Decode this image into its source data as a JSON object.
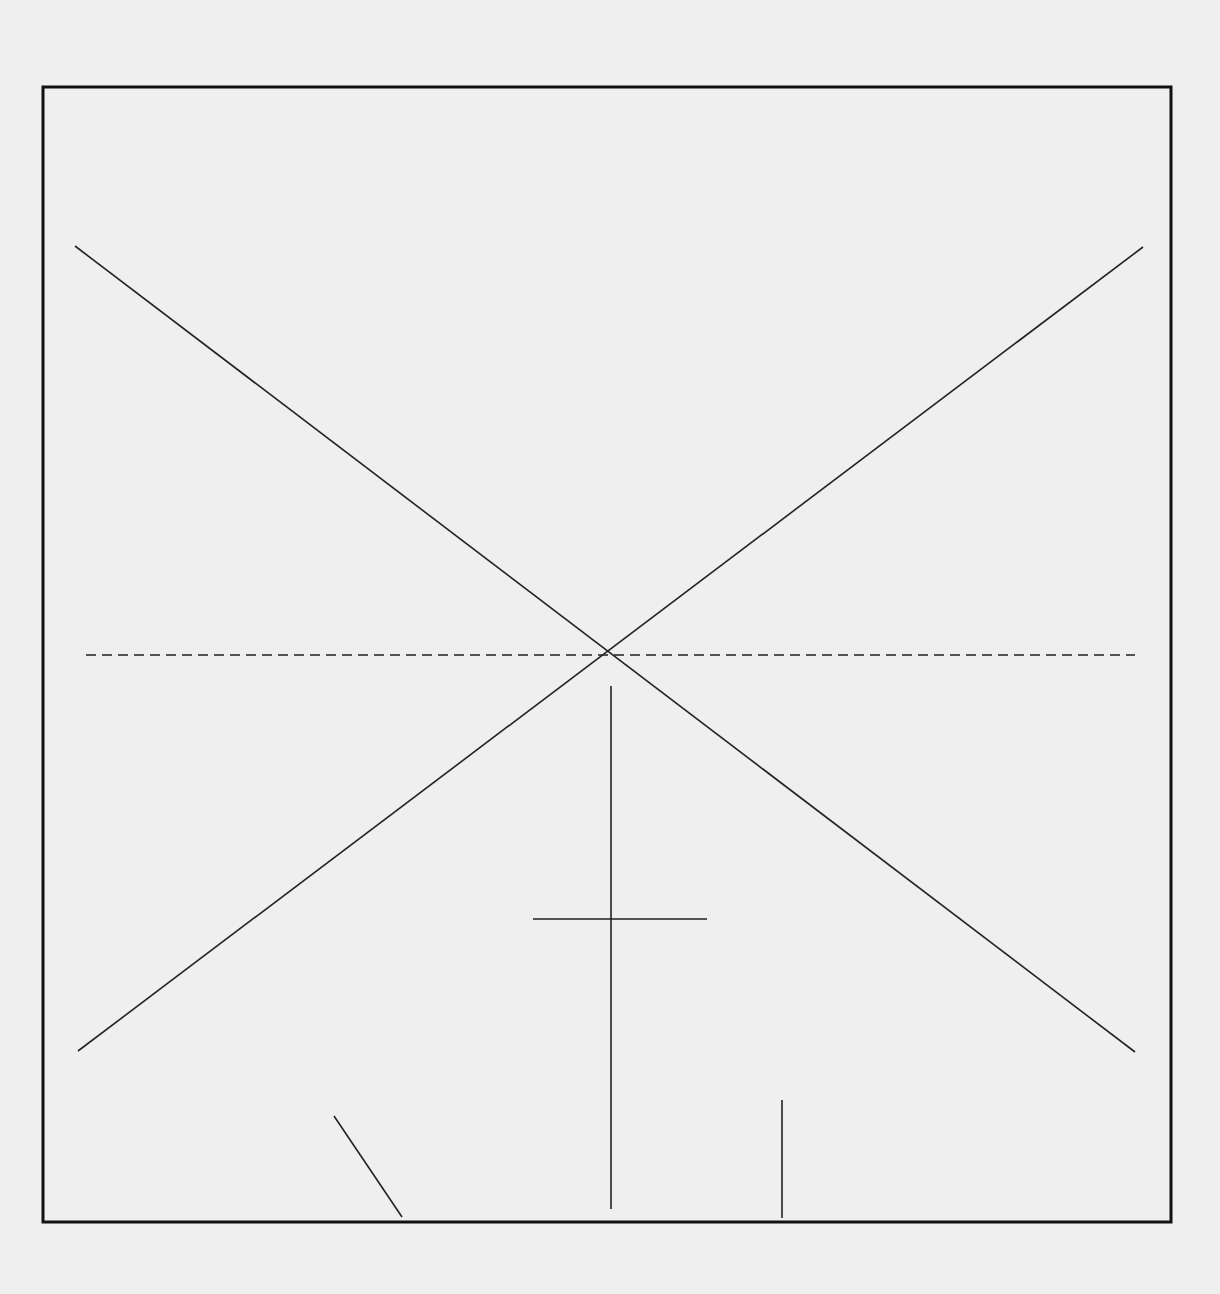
{
  "diagram": {
    "background": "#efefef",
    "stroke_color": "#222222",
    "frame": {
      "x1": 43,
      "y1": 87,
      "x2": 1171,
      "y2": 1222,
      "stroke_width": 3
    },
    "lines": [
      {
        "name": "diagonal-descending",
        "x1": 75,
        "y1": 246,
        "x2": 1135,
        "y2": 1052,
        "dashed": false
      },
      {
        "name": "diagonal-ascending",
        "x1": 78,
        "y1": 1051,
        "x2": 1143,
        "y2": 247,
        "dashed": false
      },
      {
        "name": "horizontal-dashed-axis",
        "x1": 86,
        "y1": 655,
        "x2": 1135,
        "y2": 655,
        "dashed": true
      },
      {
        "name": "vertical-center-stem",
        "x1": 611,
        "y1": 686,
        "x2": 611,
        "y2": 1209,
        "dashed": false
      },
      {
        "name": "short-crossbar",
        "x1": 533,
        "y1": 919,
        "x2": 707,
        "y2": 919,
        "dashed": false
      },
      {
        "name": "short-slanted-line",
        "x1": 334,
        "y1": 1116,
        "x2": 402,
        "y2": 1217,
        "dashed": false
      },
      {
        "name": "short-vertical-line",
        "x1": 782,
        "y1": 1100,
        "x2": 782,
        "y2": 1218,
        "dashed": false
      }
    ]
  }
}
